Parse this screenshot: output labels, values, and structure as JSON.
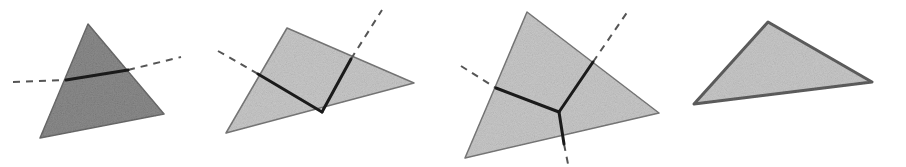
{
  "figure": {
    "panel_count": 4,
    "background_color": "#ffffff",
    "canvas": {
      "width": 906,
      "height": 167
    }
  },
  "style": {
    "dark_fill": "#8c8c8c",
    "light_fill": "#c8c8c8",
    "edge_color": "#7a7a7a",
    "dark_edge_color": "#6e6e6e",
    "cut_color": "#1a1a1a",
    "dash_color": "#555555",
    "cut_width": "3",
    "dash_width": "2",
    "dash_pattern": "7 6",
    "noise_opacity": "0.30"
  },
  "panels": [
    {
      "id": "panel-1",
      "name": "triangle-one-cut",
      "fill": "#8c8c8c",
      "edge": "#6e6e6e",
      "outline_width": "1.5",
      "vertices": "88,24 164,114 40,138",
      "vertex_labels": [
        "apex",
        "bottom-right",
        "bottom-left"
      ],
      "cuts": [
        {
          "name": "cut-horizontal",
          "points": "66,80 128,70"
        }
      ],
      "dashes": [
        {
          "name": "dash-left",
          "points": "13,82 66,80"
        },
        {
          "name": "dash-right",
          "points": "128,70 181,57"
        }
      ],
      "cut_count": 1
    },
    {
      "id": "panel-2",
      "name": "triangle-two-cuts",
      "fill": "#c8c8c8",
      "edge": "#7a7a7a",
      "outline_width": "1.5",
      "vertices": "287,28 414,83 226,133",
      "vertex_labels": [
        "top",
        "right",
        "bottom-left"
      ],
      "cuts": [
        {
          "name": "cut-lower-left",
          "points": "258,74 322,112"
        },
        {
          "name": "cut-upper-right",
          "points": "322,112 351,59"
        }
      ],
      "dashes": [
        {
          "name": "dash-left",
          "points": "218,51 258,74"
        },
        {
          "name": "dash-upper-right",
          "points": "351,59 382,10"
        }
      ],
      "cut_count": 2
    },
    {
      "id": "panel-3",
      "name": "triangle-steiner-three-cuts",
      "fill": "#c8c8c8",
      "edge": "#7a7a7a",
      "outline_width": "1.5",
      "vertices": "527,12 659,113 465,158",
      "vertex_labels": [
        "apex",
        "right",
        "bottom-left"
      ],
      "steiner_point": "559,112",
      "cuts": [
        {
          "name": "cut-branch-left",
          "points": "496,88 559,112"
        },
        {
          "name": "cut-branch-upper-right",
          "points": "559,112 593,62"
        },
        {
          "name": "cut-branch-down",
          "points": "559,112 564,144"
        }
      ],
      "dashes": [
        {
          "name": "dash-left",
          "points": "461,66 496,88"
        },
        {
          "name": "dash-upper-right",
          "points": "593,62 628,11"
        },
        {
          "name": "dash-bottom",
          "points": "564,144 568,164"
        }
      ],
      "cut_count": 3
    },
    {
      "id": "panel-4",
      "name": "triangle-no-cuts",
      "fill": "#c8c8c8",
      "edge": "#5f5f5f",
      "outline_width": "3",
      "vertices": "768,22 872,82 694,104",
      "vertex_labels": [
        "apex",
        "right",
        "bottom-left"
      ],
      "cuts": [],
      "dashes": [],
      "cut_count": 0
    }
  ]
}
